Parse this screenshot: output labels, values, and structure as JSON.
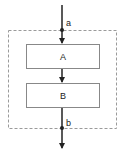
{
  "diagram": {
    "title": "",
    "container": {
      "style": "dashed",
      "color": "#999999"
    },
    "blocks": [
      {
        "id": "A",
        "label": "A"
      },
      {
        "id": "B",
        "label": "B"
      }
    ],
    "points": [
      {
        "id": "a",
        "label": "a"
      },
      {
        "id": "b",
        "label": "b"
      }
    ],
    "edges": [
      {
        "from": "input",
        "to": "A",
        "via": "a"
      },
      {
        "from": "A",
        "to": "B"
      },
      {
        "from": "B",
        "to": "output",
        "via": "b"
      }
    ],
    "colors": {
      "line": "#222222",
      "box_border": "#888888",
      "dashed": "#9a9a9a"
    }
  }
}
